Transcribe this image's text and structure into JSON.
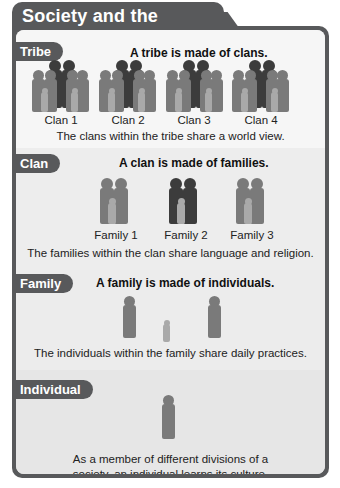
{
  "title": "Society and the Individual",
  "colors": {
    "frame": "#58595b",
    "panel_light": "#f6f6f6",
    "panel_mid": "#ececec",
    "figure_dark": "#3c3c3c",
    "figure_mid": "#7a7a7a",
    "figure_light": "#a9a9a9"
  },
  "sections": [
    {
      "label": "Tribe",
      "heading": "A tribe is made of clans.",
      "items": [
        "Clan 1",
        "Clan 2",
        "Clan 3",
        "Clan 4"
      ],
      "caption": "The clans within the tribe share a world view."
    },
    {
      "label": "Clan",
      "heading": "A clan is made of families.",
      "items": [
        "Family 1",
        "Family 2",
        "Family 3"
      ],
      "caption": "The families within the clan share language and religion."
    },
    {
      "label": "Family",
      "heading": "A family is made of individuals.",
      "items": [],
      "caption": "The individuals within the family share daily practices."
    },
    {
      "label": "Individual",
      "heading": "",
      "items": [],
      "caption_lines": [
        "As a member of different divisions of a",
        "society, an individual learns its culture."
      ]
    }
  ]
}
